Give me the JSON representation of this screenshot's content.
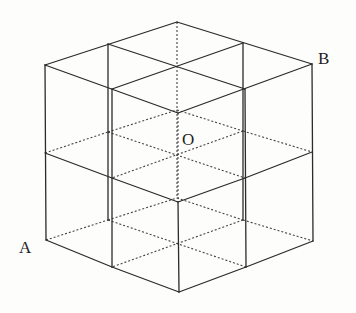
{
  "figure": {
    "labels": [
      {
        "id": "A",
        "text": "A",
        "x": 19,
        "y": 239
      },
      {
        "id": "B",
        "text": "B",
        "x": 318,
        "y": 50
      },
      {
        "id": "O",
        "text": "O",
        "x": 182,
        "y": 131
      }
    ],
    "colors": {
      "line": "#2b2b2b",
      "background": "#fdfdfb"
    },
    "solid_segments": [
      [
        177,
        22,
        312,
        64
      ],
      [
        312,
        64,
        178,
        113
      ],
      [
        178,
        113,
        45,
        65
      ],
      [
        45,
        65,
        177,
        22
      ],
      [
        108,
        44,
        245,
        89
      ],
      [
        243,
        43,
        112,
        89
      ],
      [
        45,
        65,
        46,
        240
      ],
      [
        312,
        64,
        313,
        241
      ],
      [
        112,
        89,
        112,
        267
      ],
      [
        245,
        89,
        246,
        267
      ],
      [
        108,
        44,
        108,
        220
      ],
      [
        243,
        43,
        243,
        220
      ],
      [
        178,
        202,
        179,
        292
      ],
      [
        45,
        153,
        112,
        178
      ],
      [
        112,
        178,
        178,
        202
      ],
      [
        178,
        202,
        245,
        178
      ],
      [
        245,
        178,
        312,
        152
      ],
      [
        46,
        240,
        112,
        267
      ],
      [
        112,
        267,
        179,
        292
      ],
      [
        179,
        292,
        246,
        267
      ],
      [
        246,
        267,
        313,
        241
      ]
    ],
    "dotted_segments": [
      [
        177,
        22,
        177,
        198
      ],
      [
        178,
        113,
        178,
        202
      ],
      [
        45,
        153,
        108,
        132
      ],
      [
        108,
        132,
        177,
        110
      ],
      [
        177,
        110,
        243,
        131
      ],
      [
        243,
        131,
        312,
        152
      ],
      [
        108,
        132,
        245,
        178
      ],
      [
        243,
        131,
        112,
        178
      ],
      [
        46,
        240,
        108,
        220
      ],
      [
        108,
        220,
        177,
        198
      ],
      [
        177,
        198,
        243,
        220
      ],
      [
        243,
        220,
        313,
        241
      ],
      [
        108,
        220,
        246,
        267
      ],
      [
        243,
        220,
        112,
        267
      ]
    ]
  }
}
